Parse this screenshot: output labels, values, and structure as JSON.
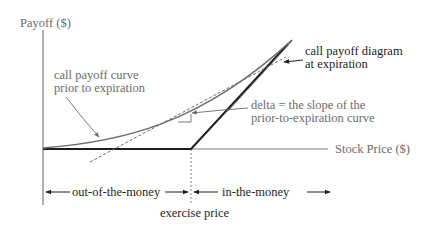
{
  "diagram": {
    "y_axis_label": "Payoff ($)",
    "x_axis_label": "Stock Price ($)",
    "annotations": {
      "prior_curve_line1": "call payoff curve",
      "prior_curve_line2": "prior to expiration",
      "expiration_line1": "call payoff diagram",
      "expiration_line2": "at expiration",
      "delta_line1": "delta = the slope of the",
      "delta_line2": "prior-to-expiration curve"
    },
    "ranges": {
      "out_of_the_money": "out-of-the-money",
      "in_the_money": "in-the-money"
    },
    "strike_label": "exercise price",
    "colors": {
      "curve": "#6b6b6b",
      "expiration_line": "#1e1e1e",
      "axis": "#6b6b6b",
      "text_gray": "#6b6b6b",
      "text_dark": "#1e1e1e"
    }
  }
}
